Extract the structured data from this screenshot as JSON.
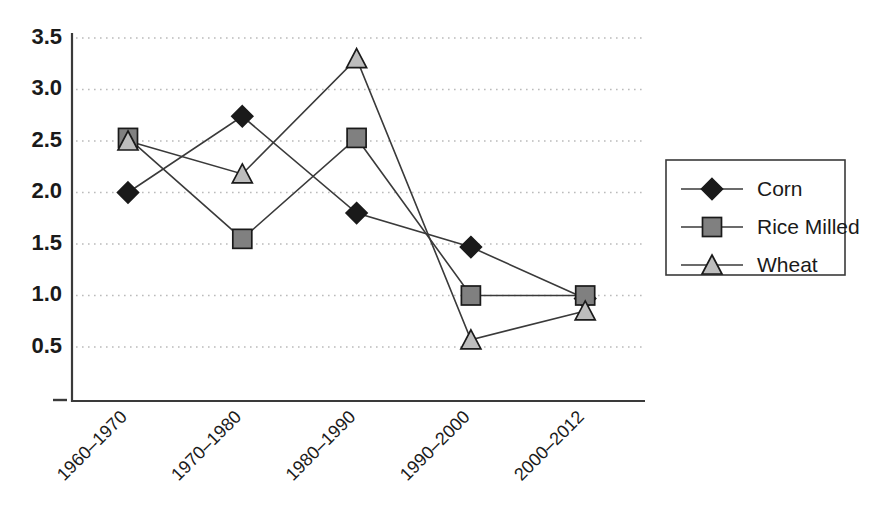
{
  "chart_data": {
    "type": "line",
    "title": "",
    "subtitle": "",
    "xlabel": "",
    "ylabel": "",
    "categories": [
      "1960–1970",
      "1970–1980",
      "1980–1990",
      "1990–2000",
      "2000–2012"
    ],
    "series": [
      {
        "name": "Corn",
        "values": [
          2.0,
          2.74,
          1.8,
          1.47,
          0.97
        ],
        "marker": "diamond",
        "marker_fill": "#1a1a1a"
      },
      {
        "name": "Rice Milled",
        "values": [
          2.53,
          1.55,
          2.53,
          1.0,
          1.0
        ],
        "marker": "square",
        "marker_fill": "#808080"
      },
      {
        "name": "Wheat",
        "values": [
          2.5,
          2.18,
          3.3,
          0.57,
          0.85
        ],
        "marker": "triangle",
        "marker_fill": "#bdbdbd"
      }
    ],
    "ylim": [
      0.0,
      3.5
    ],
    "yticks": [
      3.5,
      3.0,
      2.5,
      2.0,
      1.5,
      1.0,
      0.5
    ],
    "ytick_labels": [
      "3.5",
      "3.0",
      "2.5",
      "2.0",
      "1.5",
      "1.0",
      "0.5"
    ],
    "grid": true,
    "grid_axis": "y",
    "grid_style": "dotted",
    "legend_position": "right",
    "legend_entries": [
      "Corn",
      "Rice Milled",
      "Wheat"
    ],
    "origin_tick_label": "–",
    "colors": {
      "axis": "#3a3a3a",
      "grid": "#bbbbbb",
      "line": "#3a3a3a",
      "corn": "#1a1a1a",
      "rice_milled": "#808080",
      "wheat": "#bdbdbd",
      "background": "#ffffff"
    }
  }
}
